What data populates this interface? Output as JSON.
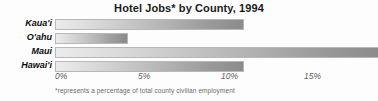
{
  "chart_data": {
    "type": "bar",
    "orientation": "horizontal",
    "title": "Hotel Jobs* by County, 1994",
    "footnote": "*represents a percentage of total county civilian employment",
    "xlabel": "",
    "ylabel": "",
    "categories": [
      "Kaua'i",
      "O'ahu",
      "Maui",
      "Hawai'i"
    ],
    "values": [
      11.4,
      4.4,
      19.5,
      11.4
    ],
    "value_unit": "%",
    "xlim": [
      0,
      19.5
    ],
    "xticks": [
      0,
      5,
      10,
      15
    ],
    "xtick_labels": [
      "0%",
      "5%",
      "10%",
      "15%"
    ],
    "grid": false,
    "legend": "none",
    "bars": [
      {
        "category": "Kaua'i",
        "value": 11.4,
        "clipped": false
      },
      {
        "category": "O'ahu",
        "value": 4.4,
        "clipped": false
      },
      {
        "category": "Maui",
        "value": 19.5,
        "clipped": true
      },
      {
        "category": "Hawai'i",
        "value": 11.4,
        "clipped": false
      }
    ],
    "colors": {
      "bar_gradient_start": "#ececec",
      "bar_gradient_end": "#8b8b8b",
      "bar_border": "#b8b8b8",
      "title_text": "#1a1a1a",
      "category_text": "#0d0d0d",
      "tick_text": "#5d5d5d",
      "footnote_text": "#6a6a6a",
      "background": "#fdfdfd"
    }
  }
}
